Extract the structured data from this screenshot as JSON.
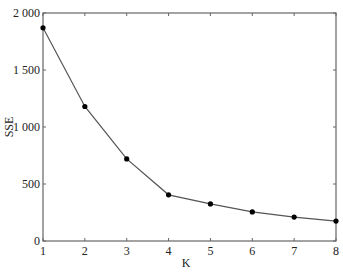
{
  "chart_data": {
    "type": "line",
    "title": "",
    "xlabel": "K",
    "ylabel": "SSE",
    "x": [
      1,
      2,
      3,
      4,
      5,
      6,
      7,
      8
    ],
    "series": [
      {
        "name": "SSE",
        "values": [
          1870,
          1180,
          720,
          405,
          325,
          255,
          210,
          175
        ]
      }
    ],
    "xlim": [
      1,
      8
    ],
    "ylim": [
      0,
      2000
    ],
    "xticks": [
      "1",
      "2",
      "3",
      "4",
      "5",
      "6",
      "7",
      "8"
    ],
    "yticks": [
      {
        "value": 0,
        "label": "0"
      },
      {
        "value": 500,
        "label": "500"
      },
      {
        "value": 1000,
        "label": "1 000"
      },
      {
        "value": 1500,
        "label": "1 500"
      },
      {
        "value": 2000,
        "label": "2 000"
      }
    ],
    "grid": false,
    "legend": null,
    "markers": true,
    "line_color": "#555555",
    "marker_color": "#000000"
  }
}
